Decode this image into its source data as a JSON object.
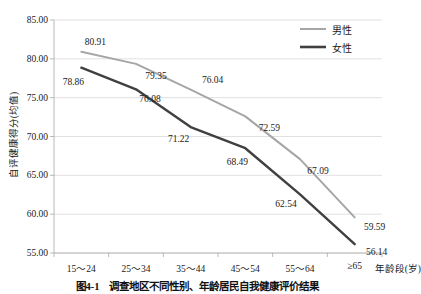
{
  "chart_data": {
    "type": "line",
    "title": "",
    "categories": [
      "15～24",
      "25～34",
      "35～44",
      "45～54",
      "55～64",
      "≥65"
    ],
    "series": [
      {
        "name": "男性",
        "color": "#a6a6a6",
        "values": [
          80.91,
          79.35,
          76.04,
          72.59,
          67.09,
          59.59
        ],
        "labels": [
          "80.91",
          "79.35",
          "76.04",
          "72.59",
          "67.09",
          "59.59"
        ]
      },
      {
        "name": "女性",
        "color": "#404040",
        "values": [
          78.86,
          76.08,
          71.22,
          68.49,
          62.54,
          56.14
        ],
        "labels": [
          "78.86",
          "76.08",
          "71.22",
          "68.49",
          "62.54",
          "56.14"
        ]
      }
    ],
    "xlabel": "年龄段(岁)",
    "ylabel": "自评健康得分(均值)",
    "ylim": [
      55.0,
      85.0
    ],
    "ytick_labels": [
      "85.00",
      "80.00",
      "75.00",
      "70.00",
      "65.00",
      "60.00",
      "55.00"
    ],
    "ytick_values": [
      85.0,
      80.0,
      75.0,
      70.0,
      65.0,
      60.0,
      55.0
    ],
    "grid": "horizontal",
    "legend_position": "top-right"
  },
  "legend": {
    "entries": [
      {
        "label": "男性"
      },
      {
        "label": "女性"
      }
    ]
  },
  "caption": {
    "text": "图4-1　调查地区不同性别、年龄居民自我健康评价结果"
  }
}
